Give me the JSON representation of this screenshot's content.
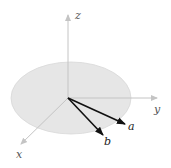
{
  "diagram": {
    "type": "3d-coordinate-axes-with-vectors",
    "colors": {
      "background": "#ffffff",
      "plane_fill": "#e6e6e6",
      "plane_stroke": "#d8d8d8",
      "axis": "#c4c4c4",
      "vector": "#111111"
    },
    "origin": [
      68,
      98
    ],
    "plane": {
      "cx": 71,
      "cy": 98,
      "rx": 60,
      "ry": 36
    },
    "axes": [
      {
        "name": "z",
        "label": "z",
        "end": [
          68,
          14
        ],
        "label_pos": [
          76,
          19
        ]
      },
      {
        "name": "y",
        "label": "y",
        "end": [
          158,
          98
        ],
        "label_pos": [
          154,
          112
        ]
      },
      {
        "name": "x",
        "label": "x",
        "end": [
          20,
          145
        ],
        "label_pos": [
          16,
          157
        ]
      }
    ],
    "vectors": [
      {
        "name": "a",
        "label": "a",
        "end": [
          126,
          124
        ],
        "label_pos": [
          129,
          129
        ]
      },
      {
        "name": "b",
        "label": "b",
        "end": [
          104,
          136
        ],
        "label_pos": [
          105,
          143
        ]
      }
    ]
  }
}
